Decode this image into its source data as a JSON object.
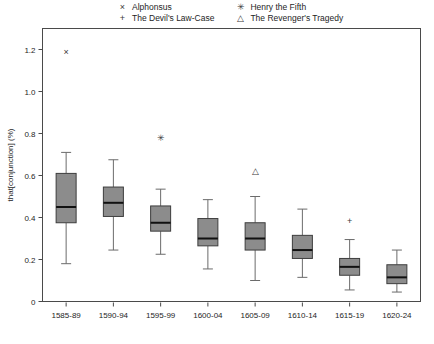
{
  "legend": {
    "entries": [
      {
        "marker": "cross-x-icon",
        "glyph": "×",
        "label": "Alphonsus"
      },
      {
        "marker": "plus-icon",
        "glyph": "+",
        "label": "Henry the Fifth"
      },
      {
        "marker": "asterisk-icon",
        "glyph": "✳",
        "label": "The Devil's Law-Case"
      },
      {
        "marker": "triangle-up-icon",
        "glyph": "△",
        "label": "The Revenger's Tragedy"
      }
    ],
    "order": [
      {
        "col": 0,
        "row": 0,
        "glyph": "×",
        "label": "Alphonsus",
        "name": "legend-alphonsus"
      },
      {
        "col": 0,
        "row": 1,
        "glyph": "+",
        "label": "The Devil's Law-Case",
        "name": "legend-devils-law-case"
      },
      {
        "col": 1,
        "row": 0,
        "glyph": "✳",
        "label": "Henry the Fifth",
        "name": "legend-henry-the-fifth"
      },
      {
        "col": 1,
        "row": 1,
        "glyph": "△",
        "label": "The Revenger's Tragedy",
        "name": "legend-revengers-tragedy"
      }
    ]
  },
  "axes": {
    "ylabel": "that[conjunction] (%)",
    "yticks": [
      "0",
      "0.2",
      "0.4",
      "0.6",
      "0.8",
      "1.0",
      "1.2"
    ],
    "xticks": [
      "1585-89",
      "1590-94",
      "1595-99",
      "1600-04",
      "1605-09",
      "1610-14",
      "1615-19",
      "1620-24"
    ]
  },
  "caption": "",
  "colors": {
    "box_fill": "#8c8c8c",
    "box_edge": "#3d3d3d",
    "median": "#111111",
    "whisker": "#6b6b6b",
    "frame": "#4a4a4a",
    "marker": "#3a3a3a"
  },
  "chart_data": {
    "type": "box",
    "title": "",
    "xlabel": "",
    "ylabel": "that[conjunction] (%)",
    "ylim": [
      0,
      1.3
    ],
    "ytick_values": [
      0,
      0.2,
      0.4,
      0.6,
      0.8,
      1.0,
      1.2
    ],
    "grid": false,
    "legend_position": "top",
    "categories": [
      "1585-89",
      "1590-94",
      "1595-99",
      "1600-04",
      "1605-09",
      "1610-14",
      "1615-19",
      "1620-24"
    ],
    "boxes": [
      {
        "category": "1585-89",
        "whisker_low": 0.18,
        "q1": 0.375,
        "median": 0.45,
        "q3": 0.61,
        "whisker_high": 0.71
      },
      {
        "category": "1590-94",
        "whisker_low": 0.245,
        "q1": 0.405,
        "median": 0.47,
        "q3": 0.545,
        "whisker_high": 0.675
      },
      {
        "category": "1595-99",
        "whisker_low": 0.225,
        "q1": 0.335,
        "median": 0.375,
        "q3": 0.455,
        "whisker_high": 0.535
      },
      {
        "category": "1600-04",
        "whisker_low": 0.155,
        "q1": 0.265,
        "median": 0.3,
        "q3": 0.395,
        "whisker_high": 0.485
      },
      {
        "category": "1605-09",
        "whisker_low": 0.1,
        "q1": 0.245,
        "median": 0.3,
        "q3": 0.375,
        "whisker_high": 0.5
      },
      {
        "category": "1610-14",
        "whisker_low": 0.115,
        "q1": 0.205,
        "median": 0.245,
        "q3": 0.315,
        "whisker_high": 0.44
      },
      {
        "category": "1615-19",
        "whisker_low": 0.055,
        "q1": 0.125,
        "median": 0.165,
        "q3": 0.205,
        "whisker_high": 0.295
      },
      {
        "category": "1620-24",
        "whisker_low": 0.045,
        "q1": 0.085,
        "median": 0.115,
        "q3": 0.175,
        "whisker_high": 0.245
      }
    ],
    "outliers": [
      {
        "category": "1585-89",
        "value": 1.19,
        "label": "Alphonsus",
        "glyph": "×",
        "marker": "cross-x-icon"
      },
      {
        "category": "1595-99",
        "value": 0.78,
        "label": "Henry the Fifth",
        "glyph": "✳",
        "marker": "asterisk-icon"
      },
      {
        "category": "1605-09",
        "value": 0.625,
        "label": "The Revenger's Tragedy",
        "glyph": "△",
        "marker": "triangle-up-icon"
      },
      {
        "category": "1615-19",
        "value": 0.385,
        "label": "The Devil's Law-Case",
        "glyph": "+",
        "marker": "plus-icon"
      }
    ]
  }
}
